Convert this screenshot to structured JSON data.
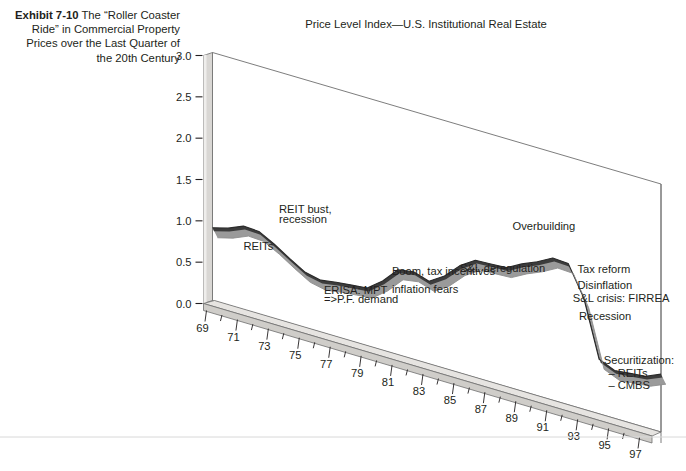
{
  "exhibit": {
    "label": "Exhibit 7-10",
    "caption": "The “Roller Coaster Ride” in Commercial Property Prices over the Last Quarter of the 20th Century"
  },
  "chart_title": "Price Level Index—U.S. Institutional Real Estate",
  "colors": {
    "line_top": "#3c3c3c",
    "line_shade": "#9a9a9a",
    "wall": "#d4d2cf",
    "floor": "#d4d2cf",
    "outline": "#6e6e6e",
    "text": "#231f20"
  },
  "chart_data": {
    "type": "line",
    "title": "Price Level Index—U.S. Institutional Real Estate",
    "xlabel": "",
    "ylabel": "",
    "grid": false,
    "legend": "none",
    "projection": "3d-perspective",
    "ylim": [
      0.0,
      3.0
    ],
    "yticks": [
      "0.0",
      "0.5",
      "1.0",
      "1.5",
      "2.0",
      "2.5",
      "3.0"
    ],
    "ytick_values": [
      0.0,
      0.5,
      1.0,
      1.5,
      2.0,
      2.5,
      3.0
    ],
    "xlim": [
      69,
      98
    ],
    "xticks": [
      "69",
      "71",
      "73",
      "75",
      "77",
      "79",
      "81",
      "83",
      "85",
      "87",
      "89",
      "91",
      "93",
      "95",
      "97"
    ],
    "xtick_values": [
      69,
      71,
      73,
      75,
      77,
      79,
      81,
      83,
      85,
      87,
      89,
      91,
      93,
      95,
      97
    ],
    "x": [
      69,
      70,
      71,
      72,
      73,
      74,
      75,
      76,
      77,
      78,
      79,
      80,
      81,
      82,
      83,
      84,
      85,
      86,
      87,
      88,
      89,
      90,
      91,
      92,
      93,
      94,
      95,
      96,
      97,
      98
    ],
    "values": [
      0.88,
      0.93,
      1.01,
      1.0,
      0.9,
      0.78,
      0.67,
      0.63,
      0.66,
      0.68,
      0.7,
      0.84,
      1.03,
      1.06,
      1.0,
      1.12,
      1.3,
      1.42,
      1.43,
      1.44,
      1.54,
      1.62,
      1.72,
      1.71,
      1.35,
      0.66,
      0.58,
      0.6,
      0.62,
      0.7
    ],
    "series": [
      {
        "name": "Price Level Index",
        "values": [
          0.88,
          0.93,
          1.01,
          1.0,
          0.9,
          0.78,
          0.67,
          0.63,
          0.66,
          0.68,
          0.7,
          0.84,
          1.03,
          1.06,
          1.0,
          1.12,
          1.3,
          1.42,
          1.43,
          1.44,
          1.54,
          1.62,
          1.72,
          1.71,
          1.35,
          0.66,
          0.58,
          0.6,
          0.62,
          0.7
        ]
      }
    ],
    "annotations": [
      {
        "text": "REITs",
        "x": 71.0,
        "y": 0.72
      },
      {
        "text": "REIT bust,",
        "x": 73.3,
        "y": 1.3
      },
      {
        "text": "recession",
        "x": 73.3,
        "y": 1.18
      },
      {
        "text": "ERISA: MPT",
        "x": 76.2,
        "y": 0.47
      },
      {
        "text": "=>P.F. demand",
        "x": 76.2,
        "y": 0.36
      },
      {
        "text": "Boom, tax incentives",
        "x": 80.6,
        "y": 0.95
      },
      {
        "text": "inflation fears",
        "x": 80.6,
        "y": 0.73
      },
      {
        "text": "S&L deregulation",
        "x": 85.0,
        "y": 1.22
      },
      {
        "text": "Overbuilding",
        "x": 88.4,
        "y": 1.92
      },
      {
        "text": "Tax reform",
        "x": 92.6,
        "y": 1.63
      },
      {
        "text": "Disinflation",
        "x": 92.6,
        "y": 1.44
      },
      {
        "text": "S&L crisis: FIRREA",
        "x": 92.3,
        "y": 1.26
      },
      {
        "text": "Recession",
        "x": 92.7,
        "y": 1.06
      },
      {
        "text": "Securitization:",
        "x": 94.3,
        "y": 0.62
      },
      {
        "text": "– REITs",
        "x": 94.6,
        "y": 0.48
      },
      {
        "text": "– CMBS",
        "x": 94.6,
        "y": 0.34
      }
    ]
  }
}
